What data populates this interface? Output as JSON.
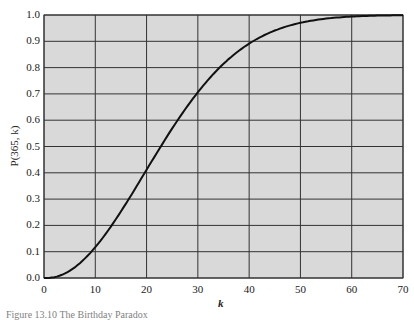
{
  "chart_data": {
    "type": "line",
    "title": "",
    "xlabel": "k",
    "ylabel": "P(365, k)",
    "xlim": [
      0,
      70
    ],
    "ylim": [
      0.0,
      1.0
    ],
    "grid": true,
    "legend": null,
    "x_ticks": [
      "0",
      "10",
      "20",
      "30",
      "40",
      "50",
      "60",
      "70"
    ],
    "y_ticks": [
      "0.0",
      "0.1",
      "0.2",
      "0.3",
      "0.4",
      "0.5",
      "0.6",
      "0.7",
      "0.8",
      "0.9",
      "1.0"
    ],
    "series": [
      {
        "name": "P(365, k)",
        "x": [
          0,
          1,
          2,
          5,
          8,
          10,
          12,
          15,
          18,
          20,
          23,
          25,
          28,
          30,
          33,
          35,
          38,
          40,
          45,
          50,
          55,
          60,
          65,
          70
        ],
        "values": [
          0.0,
          0.0,
          0.003,
          0.027,
          0.074,
          0.117,
          0.167,
          0.253,
          0.347,
          0.411,
          0.507,
          0.569,
          0.654,
          0.706,
          0.775,
          0.814,
          0.864,
          0.891,
          0.941,
          0.97,
          0.986,
          0.994,
          0.998,
          0.999
        ]
      }
    ],
    "background_color": "#d9d9d9",
    "line_color": "#111111",
    "grid_color": "#333333"
  },
  "caption": "Figure 13.10   The Birthday Paradox"
}
